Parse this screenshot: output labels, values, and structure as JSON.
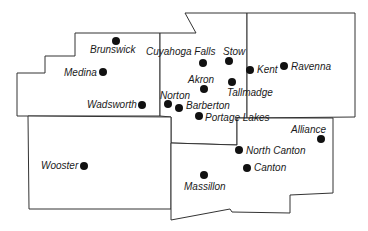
{
  "map": {
    "counties": [
      {
        "id": "medina",
        "points": "75,33 160,33 160,116 17,116 17,73 45,73 45,56 75,56"
      },
      {
        "id": "summit",
        "points": "160,33 196,33 185,13 247,13 247,118 237,118 237,145 171,143 171,117 160,116"
      },
      {
        "id": "portage",
        "points": "247,13 355,13 355,117 247,118"
      },
      {
        "id": "wayne",
        "points": "28,116 171,117 171,209 29,209"
      },
      {
        "id": "stark",
        "points": "171,143 237,145 237,118 333,118 333,193 290,195 290,213 232,212 230,209 171,220"
      }
    ],
    "cities": [
      {
        "name": "Brunswick",
        "x": 116,
        "y": 41,
        "label": "Brunswick",
        "lx": 90,
        "ly": 53
      },
      {
        "name": "Medina",
        "x": 103,
        "y": 72,
        "label": "Medina",
        "lx": 64,
        "ly": 76
      },
      {
        "name": "Wadsworth",
        "x": 142,
        "y": 105,
        "label": "Wadsworth",
        "lx": 87,
        "ly": 108
      },
      {
        "name": "Cuyahoga Falls",
        "x": 203,
        "y": 63,
        "label": "Cuyahoga Falls",
        "lx": 146,
        "ly": 55
      },
      {
        "name": "Stow",
        "x": 229,
        "y": 61,
        "label": "Stow",
        "lx": 223,
        "ly": 55
      },
      {
        "name": "Kent",
        "x": 250,
        "y": 70,
        "label": "Kent",
        "lx": 257,
        "ly": 73
      },
      {
        "name": "Ravenna",
        "x": 284,
        "y": 66,
        "label": "Ravenna",
        "lx": 291,
        "ly": 70
      },
      {
        "name": "Akron",
        "x": 204,
        "y": 89,
        "label": "Akron",
        "lx": 188,
        "ly": 83
      },
      {
        "name": "Tallmadge",
        "x": 232,
        "y": 82,
        "label": "Tallmadge",
        "lx": 227,
        "ly": 96
      },
      {
        "name": "Norton",
        "x": 168,
        "y": 104,
        "label": "Norton",
        "lx": 160,
        "ly": 99
      },
      {
        "name": "Barberton",
        "x": 179,
        "y": 108,
        "label": "Barberton",
        "lx": 186,
        "ly": 109
      },
      {
        "name": "Portage Lakes",
        "x": 199,
        "y": 116,
        "label": "Portage Lakes",
        "lx": 205,
        "ly": 121
      },
      {
        "name": "Alliance",
        "x": 321,
        "y": 139,
        "label": "Alliance",
        "lx": 291,
        "ly": 133
      },
      {
        "name": "North Canton",
        "x": 239,
        "y": 150,
        "label": "North Canton",
        "lx": 246,
        "ly": 154
      },
      {
        "name": "Canton",
        "x": 247,
        "y": 168,
        "label": "Canton",
        "lx": 254,
        "ly": 171
      },
      {
        "name": "Massillon",
        "x": 204,
        "y": 175,
        "label": "Massillon",
        "lx": 184,
        "ly": 190
      },
      {
        "name": "Wooster",
        "x": 84,
        "y": 166,
        "label": "Wooster",
        "lx": 41,
        "ly": 169
      }
    ],
    "colors": {
      "boundary": "#333333",
      "dot": "#111111",
      "label": "#1a1a1a",
      "background": "#ffffff"
    }
  }
}
